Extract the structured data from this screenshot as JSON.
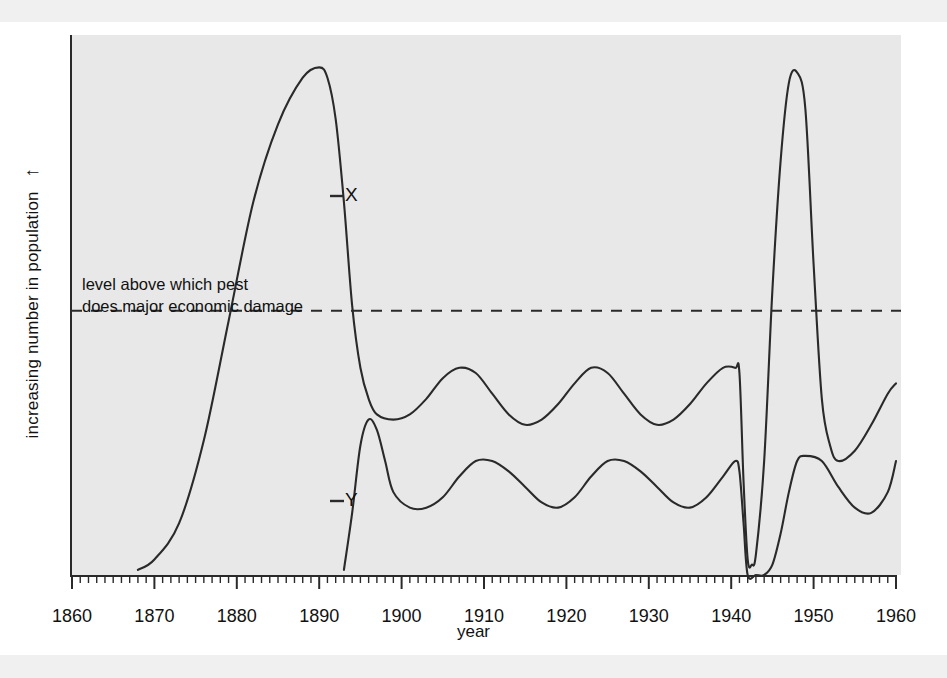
{
  "figure": {
    "kind": "line-graph",
    "background_color": "#e8e8e8",
    "ink_color": "#2a2a2a"
  },
  "axes": {
    "y_label": "increasing number in population",
    "y_arrow": "↑",
    "x_label": "year",
    "x_ticks": [
      "1860",
      "1870",
      "1880",
      "1890",
      "1900",
      "1910",
      "1920",
      "1930",
      "1940",
      "1950",
      "1960"
    ],
    "x_minor_tick_interval": "1",
    "y_ticks": []
  },
  "annotations": {
    "threshold_line1": "level above which pest",
    "threshold_line2": "does major economic damage",
    "curve_x_label": "X",
    "curve_y_label": "Y"
  },
  "chart_data": {
    "type": "line",
    "title": "",
    "xlabel": "year",
    "ylabel": "increasing number in population",
    "xlim": [
      1860,
      1960
    ],
    "ylim": [
      0,
      100
    ],
    "grid": false,
    "legend": "inline-curve-labels",
    "y_axis_unlabeled": true,
    "threshold": {
      "label": "level above which pest does major economic damage",
      "value": 51,
      "style": "dashed"
    },
    "series": [
      {
        "name": "X",
        "label": "X",
        "description": "pest population",
        "x": [
          1868,
          1870,
          1873,
          1876,
          1879,
          1882,
          1885,
          1888,
          1890,
          1891,
          1892,
          1893,
          1894,
          1895,
          1896,
          1897,
          1899,
          1901,
          1903,
          1905,
          1907,
          1909,
          1911,
          1913,
          1915,
          1917,
          1919,
          1921,
          1923,
          1925,
          1927,
          1929,
          1931,
          1933,
          1935,
          1937,
          1939,
          1940.5,
          1941,
          1941.5,
          1942,
          1942.5,
          1943,
          1944,
          1945,
          1946,
          1947,
          1948,
          1949,
          1950,
          1951,
          1952,
          1953,
          1955,
          1957,
          1959,
          1960
        ],
        "y": [
          1,
          3,
          10,
          26,
          49,
          72,
          87,
          96,
          98,
          96,
          88,
          72,
          52,
          40,
          34,
          31,
          30,
          31,
          34,
          38,
          40,
          39,
          35,
          31,
          29,
          30,
          33,
          37,
          40,
          39,
          35,
          31,
          29,
          30,
          33,
          37,
          40,
          40,
          39,
          18,
          3,
          2,
          4,
          22,
          55,
          80,
          95,
          97,
          90,
          60,
          34,
          25,
          22,
          24,
          29,
          35,
          37
        ]
      },
      {
        "name": "Y",
        "label": "Y",
        "description": "predator / natural enemy population",
        "x": [
          1893,
          1894,
          1895,
          1896,
          1897,
          1898,
          1899,
          1901,
          1903,
          1905,
          1907,
          1909,
          1911,
          1913,
          1915,
          1917,
          1919,
          1921,
          1923,
          1925,
          1927,
          1929,
          1931,
          1933,
          1935,
          1937,
          1939,
          1940.5,
          1941,
          1941.5,
          1942,
          1943,
          1944,
          1945,
          1946,
          1947,
          1948,
          1949,
          1951,
          1953,
          1955,
          1957,
          1959,
          1960
        ],
        "y": [
          1,
          12,
          25,
          30,
          28,
          22,
          16,
          13,
          13,
          15,
          19,
          22,
          22,
          20,
          17,
          14,
          13,
          15,
          19,
          22,
          22,
          20,
          17,
          14,
          13,
          15,
          19,
          22,
          20,
          10,
          0,
          0,
          0,
          2,
          8,
          16,
          22,
          23,
          22,
          17,
          13,
          12,
          16,
          22
        ]
      }
    ],
    "events": [
      {
        "year": 1890,
        "series": "X",
        "note": "peak of pest population"
      },
      {
        "year": 1942,
        "series": "X",
        "note": "population crashes to near zero"
      },
      {
        "year": 1942,
        "series": "Y",
        "note": "predator population collapses to zero"
      },
      {
        "year": 1948,
        "series": "X",
        "note": "resurgence spike above damage threshold"
      }
    ]
  }
}
